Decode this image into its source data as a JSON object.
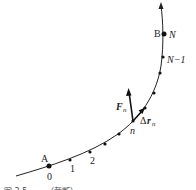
{
  "diagram": {
    "type": "path-work-diagram",
    "labels": {
      "start_point": "A",
      "end_point": "B",
      "index_0": "0",
      "index_1": "1",
      "index_2": "2",
      "index_n": "n",
      "index_N_minus_1": "N−1",
      "index_N": "N",
      "force": "F",
      "force_sub": "n",
      "displacement_delta": "Δ",
      "displacement_r": "r",
      "displacement_sub": "n"
    },
    "caption": "图 3.5  ……（截断）"
  }
}
